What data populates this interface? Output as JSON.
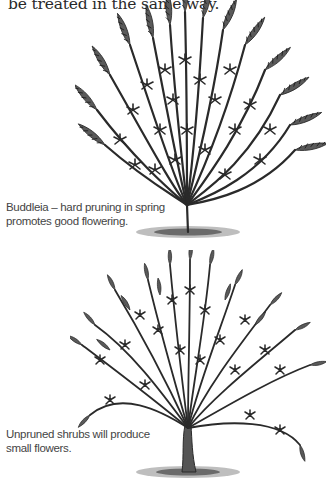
{
  "page": {
    "intro_text": "be treated in the same way.",
    "figures": [
      {
        "subject": "buddleia-hard-pruned",
        "caption": "Buddleia – hard pruning in spring promotes good flowering."
      },
      {
        "subject": "unpruned-shrub",
        "caption": "Unpruned shrubs will produce small flowers."
      }
    ]
  },
  "colors": {
    "background": "#ffffff",
    "ink": "#2a2a2a",
    "caption": "#444444"
  }
}
